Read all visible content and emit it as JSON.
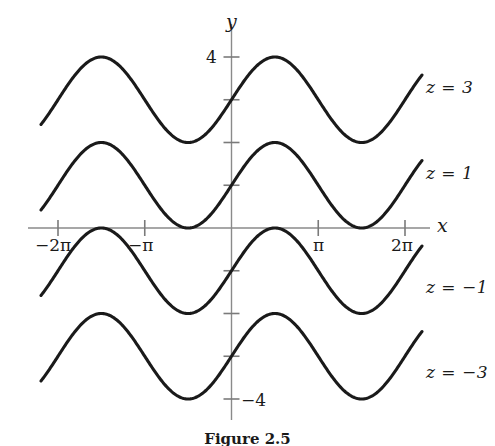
{
  "figure": {
    "axis_labels": {
      "x": "x",
      "y": "y"
    },
    "x_ticks": [
      {
        "value": -6.283185307,
        "label": "−2π"
      },
      {
        "value": -3.141592654,
        "label": "−π"
      },
      {
        "value": 3.141592654,
        "label": "π"
      },
      {
        "value": 6.283185307,
        "label": "2π"
      }
    ],
    "y_ticks": [
      {
        "value": 4,
        "label": "4"
      },
      {
        "value": 3,
        "label": ""
      },
      {
        "value": 2,
        "label": ""
      },
      {
        "value": 1,
        "label": ""
      },
      {
        "value": -1,
        "label": ""
      },
      {
        "value": -2,
        "label": ""
      },
      {
        "value": -3,
        "label": ""
      },
      {
        "value": -4,
        "label": "−4"
      }
    ],
    "curve_labels": [
      {
        "text": "z = 3",
        "z": 3
      },
      {
        "text": "z = 1",
        "z": 1
      },
      {
        "text": "z = −1",
        "z": -1
      },
      {
        "text": "z = −3",
        "z": -3
      }
    ],
    "caption": "Figure  2.5",
    "colors": {
      "curve": "#1a1a1a",
      "axis": "#7a7a7a",
      "text": "#1a1a1a",
      "background": "#ffffff"
    }
  },
  "chart_data": {
    "type": "line",
    "title": "",
    "xlabel": "x",
    "ylabel": "y",
    "xlim": [
      -7.1,
      7.1
    ],
    "ylim": [
      -4.6,
      4.8
    ],
    "grid": false,
    "legend_position": "right-inline",
    "xticks": [
      -6.283185307,
      -3.141592654,
      3.141592654,
      6.283185307
    ],
    "xticklabels": [
      "−2π",
      "−π",
      "π",
      "2π"
    ],
    "yticks": [
      4,
      3,
      2,
      1,
      -1,
      -2,
      -3,
      -4
    ],
    "yticklabels": [
      "4",
      "",
      "",
      "",
      "",
      "",
      "",
      "−4"
    ],
    "function": "y = z + sin(x)",
    "x_domain_drawn": [
      -6.9,
      6.9
    ],
    "series": [
      {
        "name": "z = 3",
        "z": 3,
        "peak_value": 4,
        "trough_value": 2,
        "value_at_x0": 3,
        "x": [
          -6.9,
          -6.0,
          -5.0,
          -4.71238898,
          -4.0,
          -3.141592654,
          -2.0,
          -1.570796327,
          -1.0,
          0.0,
          1.0,
          1.570796327,
          2.0,
          3.141592654,
          4.0,
          4.71238898,
          5.0,
          6.0,
          6.9
        ],
        "values": [
          3.579,
          3.279,
          3.959,
          4.0,
          3.757,
          3.0,
          2.091,
          2.0,
          2.159,
          3.0,
          3.841,
          4.0,
          3.909,
          3.0,
          2.243,
          2.0,
          2.041,
          2.721,
          3.421
        ]
      },
      {
        "name": "z = 1",
        "z": 1,
        "peak_value": 2,
        "trough_value": 0,
        "value_at_x0": 1,
        "x": [
          -6.9,
          -6.0,
          -5.0,
          -4.71238898,
          -4.0,
          -3.141592654,
          -2.0,
          -1.570796327,
          -1.0,
          0.0,
          1.0,
          1.570796327,
          2.0,
          3.141592654,
          4.0,
          4.71238898,
          5.0,
          6.0,
          6.9
        ],
        "values": [
          1.579,
          1.279,
          1.959,
          2.0,
          1.757,
          1.0,
          0.091,
          0.0,
          0.159,
          1.0,
          1.841,
          2.0,
          1.909,
          1.0,
          0.243,
          0.0,
          0.041,
          0.721,
          1.421
        ]
      },
      {
        "name": "z = −1",
        "z": -1,
        "peak_value": 0,
        "trough_value": -2,
        "value_at_x0": -1,
        "x": [
          -6.9,
          -6.0,
          -5.0,
          -4.71238898,
          -4.0,
          -3.141592654,
          -2.0,
          -1.570796327,
          -1.0,
          0.0,
          1.0,
          1.570796327,
          2.0,
          3.141592654,
          4.0,
          4.71238898,
          5.0,
          6.0,
          6.9
        ],
        "values": [
          -0.421,
          -0.721,
          -0.041,
          0.0,
          -0.243,
          -1.0,
          -1.909,
          -2.0,
          -1.841,
          -1.0,
          -0.159,
          0.0,
          -0.091,
          -1.0,
          -1.757,
          -2.0,
          -1.959,
          -1.279,
          -0.579
        ]
      },
      {
        "name": "z = −3",
        "z": -3,
        "peak_value": -2,
        "trough_value": -4,
        "value_at_x0": -3,
        "x": [
          -6.9,
          -6.0,
          -5.0,
          -4.71238898,
          -4.0,
          -3.141592654,
          -2.0,
          -1.570796327,
          -1.0,
          0.0,
          1.0,
          1.570796327,
          2.0,
          3.141592654,
          4.0,
          4.71238898,
          5.0,
          6.0,
          6.9
        ],
        "values": [
          -2.421,
          -2.721,
          -2.041,
          -2.0,
          -2.243,
          -3.0,
          -3.909,
          -4.0,
          -3.841,
          -3.0,
          -2.159,
          -2.0,
          -2.091,
          -3.0,
          -3.757,
          -4.0,
          -3.959,
          -3.279,
          -2.579
        ]
      }
    ]
  }
}
